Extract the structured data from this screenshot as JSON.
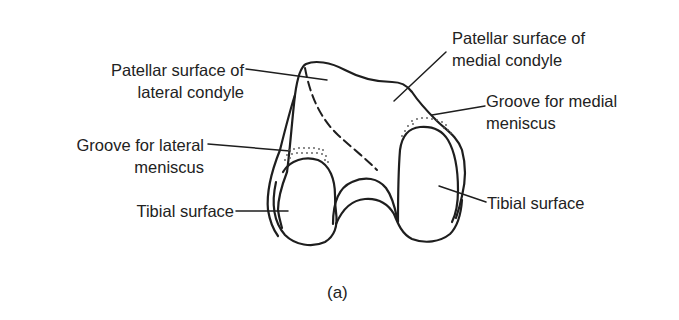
{
  "figure": {
    "caption": "(a)",
    "labels": {
      "patellar_lateral": {
        "line1": "Patellar surface of",
        "line2": "lateral condyle"
      },
      "patellar_medial": {
        "line1": "Patellar surface of",
        "line2": "medial condyle"
      },
      "groove_lateral": {
        "line1": "Groove for lateral",
        "line2": "meniscus"
      },
      "groove_medial": {
        "line1": "Groove for medial",
        "line2": "meniscus"
      },
      "tibial_left": {
        "line1": "Tibial surface"
      },
      "tibial_right": {
        "line1": "Tibial surface"
      }
    },
    "colors": {
      "ink": "#1e1e1e",
      "background": "#ffffff",
      "stipple": "#555555"
    }
  }
}
